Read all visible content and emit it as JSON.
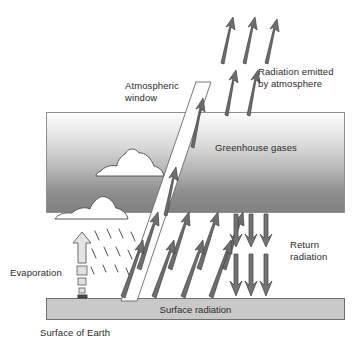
{
  "figure": {
    "title_caption": "Surface of Earth",
    "labels": {
      "atmospheric_window": "Atmospheric\nwindow",
      "radiation_emitted": "Radiation emitted\nby atmosphere",
      "greenhouse_gases": "Greenhouse gases",
      "return_radiation": "Return\nradiation",
      "evaporation": "Evaporation",
      "surface_radiation": "Surface radiation"
    },
    "colors": {
      "band_top": "#fdfdfd",
      "band_bottom": "#818181",
      "surface_bar": "#c9c9c9",
      "arrow": "#6e6e6e",
      "arrow_outline": "#3f3f3f",
      "window_fill": "#ffffff",
      "text": "#2b2b2b"
    },
    "elements": {
      "greenhouse_band": "Greenhouse gases layer",
      "surface_bar": "Earth surface slab",
      "atmospheric_window": "Atmospheric window channel",
      "clouds": 2,
      "upward_surface_arrows": 8,
      "atmosphere_emitted_arrows": 5,
      "return_radiation_arrows": 6,
      "window_arrows": 2,
      "evaporation_arrow": 1,
      "evaporation_squares": 4,
      "rain_dashes": 12
    }
  }
}
